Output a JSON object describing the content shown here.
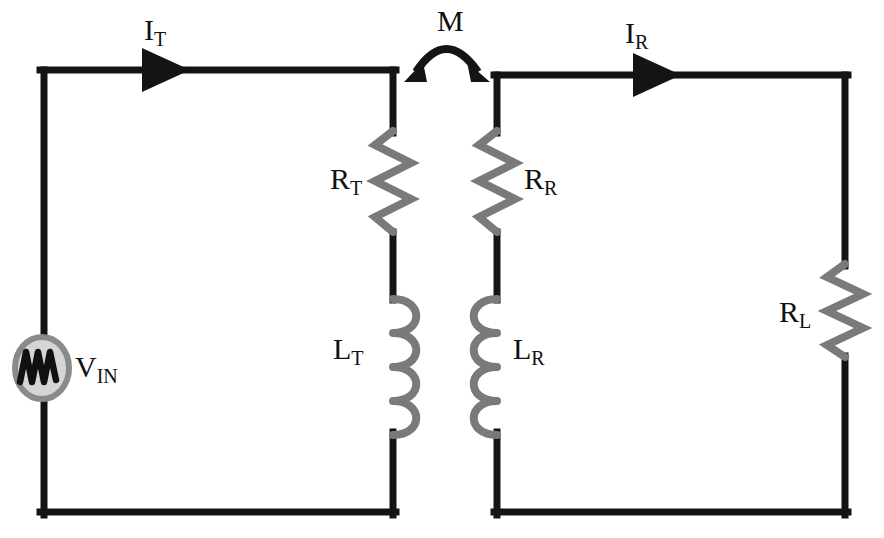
{
  "figure": {
    "name": "magnetically-coupled-resonant-circuit",
    "type": "schematic-diagram",
    "background_color": "#ffffff",
    "wire_color": "#141414",
    "component_color": "#7a7a7a",
    "source_fill_color": "#d5d5d5",
    "source_wave_color": "#111111"
  },
  "labels": {
    "current_transmit": {
      "base": "I",
      "sub": "T"
    },
    "current_receive": {
      "base": "I",
      "sub": "R"
    },
    "mutual_inductance": {
      "base": "M",
      "sub": ""
    },
    "source_voltage": {
      "base": "V",
      "sub": "IN"
    },
    "resistor_transmit": {
      "base": "R",
      "sub": "T"
    },
    "resistor_receive": {
      "base": "R",
      "sub": "R"
    },
    "resistor_load": {
      "base": "R",
      "sub": "L"
    },
    "inductor_transmit": {
      "base": "L",
      "sub": "T"
    },
    "inductor_receive": {
      "base": "L",
      "sub": "R"
    }
  },
  "components": {
    "source": {
      "name": "ac-voltage-source",
      "symbol": "sine-wave-in-circle"
    },
    "r_t": {
      "name": "resistor",
      "symbol": "zigzag"
    },
    "r_r": {
      "name": "resistor",
      "symbol": "zigzag"
    },
    "r_l": {
      "name": "resistor",
      "symbol": "zigzag"
    },
    "l_t": {
      "name": "inductor",
      "symbol": "coil"
    },
    "l_r": {
      "name": "inductor",
      "symbol": "coil"
    },
    "coupling": {
      "name": "mutual-coupling-arrow",
      "symbol": "double-headed-arc"
    },
    "arrow_t": {
      "name": "current-direction-arrow",
      "symbol": "triangle-right"
    },
    "arrow_r": {
      "name": "current-direction-arrow",
      "symbol": "triangle-right"
    }
  }
}
